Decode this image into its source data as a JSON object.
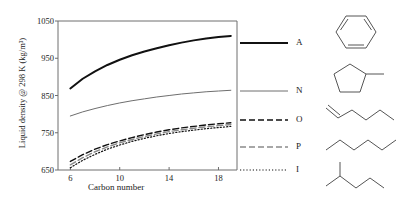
{
  "chart_data": {
    "type": "line",
    "title": "",
    "xlabel": "Carbon number",
    "ylabel": "Liquid density @ 298 K (kg/m3)",
    "ylabel_display": "Liquid density @ 298 K (kg/m³)",
    "xlim": [
      5,
      19.5
    ],
    "ylim": [
      650,
      1050
    ],
    "xticks": [
      6,
      10,
      14,
      18
    ],
    "yticks": [
      650,
      750,
      850,
      950,
      1050
    ],
    "grid": false,
    "legend_position": "right",
    "x": [
      6,
      7,
      8,
      9,
      10,
      11,
      12,
      13,
      14,
      15,
      16,
      17,
      18,
      19
    ],
    "series": [
      {
        "name": "A",
        "label": "A",
        "full_name": "Aromatics",
        "color": "#111111",
        "style": "solid",
        "width": 2.0,
        "values": [
          869,
          895,
          915,
          932,
          946,
          958,
          968,
          977,
          985,
          992,
          998,
          1003,
          1007,
          1010
        ]
      },
      {
        "name": "N",
        "label": "N",
        "full_name": "Naphthenes",
        "color": "#6e6e6e",
        "style": "solid",
        "width": 1.0,
        "values": [
          795,
          806,
          815,
          823,
          830,
          836,
          841,
          846,
          850,
          854,
          857,
          860,
          862,
          864
        ]
      },
      {
        "name": "O",
        "label": "O",
        "full_name": "Olefins",
        "color": "#111111",
        "style": "dashed",
        "width": 1.4,
        "values": [
          673,
          691,
          706,
          718,
          728,
          737,
          745,
          752,
          758,
          763,
          767,
          771,
          774,
          777
        ]
      },
      {
        "name": "P",
        "label": "P",
        "full_name": "Paraffins",
        "color": "#8a8a8a",
        "style": "dashdot",
        "width": 1.4,
        "values": [
          664,
          683,
          699,
          712,
          723,
          732,
          740,
          747,
          753,
          758,
          762,
          766,
          769,
          772
        ]
      },
      {
        "name": "I",
        "label": "I",
        "full_name": "Iso-paraffins",
        "color": "#111111",
        "style": "dotted",
        "width": 1.2,
        "values": [
          656,
          676,
          692,
          706,
          717,
          727,
          735,
          742,
          748,
          753,
          757,
          761,
          764,
          767
        ]
      }
    ]
  },
  "legend": {
    "items": [
      {
        "label": "A",
        "swatch": "legend-swatch-aromatics"
      },
      {
        "label": "N",
        "swatch": "legend-swatch-naphthenes"
      },
      {
        "label": "O",
        "swatch": "legend-swatch-olefins"
      },
      {
        "label": "P",
        "swatch": "legend-swatch-paraffins"
      },
      {
        "label": "I",
        "swatch": "legend-swatch-isoparaffins"
      }
    ]
  },
  "structures": [
    {
      "name": "benzene-ring",
      "for": "A"
    },
    {
      "name": "methylcyclopentane-ring",
      "for": "N"
    },
    {
      "name": "alkene-chain",
      "for": "O"
    },
    {
      "name": "straight-alkane-chain",
      "for": "P"
    },
    {
      "name": "branched-alkane-chain",
      "for": "I"
    }
  ],
  "axes": {
    "ylabel": "Liquid density @ 298 K (kg/m³)",
    "xlabel": "Carbon number",
    "ytick_labels": [
      "650",
      "750",
      "850",
      "950",
      "1050"
    ],
    "xtick_labels": [
      "6",
      "10",
      "14",
      "18"
    ]
  },
  "colors": {
    "axis": "#6e6e6e",
    "text": "#1a1a1a",
    "series_dark": "#111111",
    "series_gray": "#6e6e6e"
  }
}
